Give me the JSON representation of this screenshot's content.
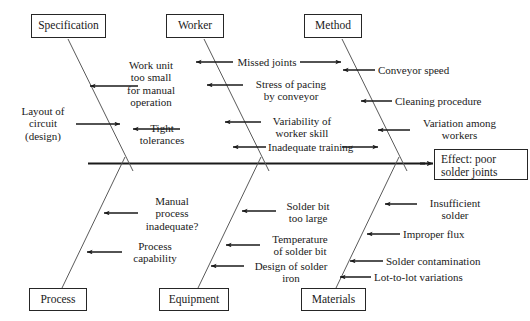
{
  "diagram": {
    "type": "fishbone",
    "line_color": "#262626",
    "background": "#ffffff",
    "effect": {
      "line1": "Effect: poor",
      "line2": "solder joints"
    },
    "categories": [
      {
        "id": "specification",
        "label": "Specification",
        "position": "top"
      },
      {
        "id": "worker",
        "label": "Worker",
        "position": "top"
      },
      {
        "id": "method",
        "label": "Method",
        "position": "top"
      },
      {
        "id": "process",
        "label": "Process",
        "position": "bottom"
      },
      {
        "id": "equipment",
        "label": "Equipment",
        "position": "bottom"
      },
      {
        "id": "materials",
        "label": "Materials",
        "position": "bottom"
      }
    ],
    "causes": {
      "specification": [
        {
          "id": "layout-of-circuit",
          "lines": [
            "Layout of",
            "circuit",
            "(design)"
          ],
          "side": "left",
          "arrow": "right"
        },
        {
          "id": "work-unit-too-small",
          "lines": [
            "Work unit",
            "too small",
            "for manual",
            "operation"
          ],
          "side": "right",
          "arrow": "left"
        },
        {
          "id": "tight-tolerances",
          "lines": [
            "Tight",
            "tolerances"
          ],
          "side": "right",
          "arrow": "left"
        }
      ],
      "worker": [
        {
          "id": "missed-joints",
          "lines": [
            "Missed joints"
          ],
          "side": "right",
          "arrow": "both"
        },
        {
          "id": "stress-of-pacing",
          "lines": [
            "Stress of pacing",
            "by conveyor"
          ],
          "side": "right",
          "arrow": "left"
        },
        {
          "id": "variability-of-worker-skill",
          "lines": [
            "Variability of",
            "worker skill"
          ],
          "side": "right",
          "arrow": "left"
        },
        {
          "id": "inadequate-training",
          "lines": [
            "Inadequate training"
          ],
          "side": "right",
          "arrow": "both"
        }
      ],
      "method": [
        {
          "id": "conveyor-speed",
          "lines": [
            "Conveyor speed"
          ],
          "side": "right",
          "arrow": "left"
        },
        {
          "id": "cleaning-procedure",
          "lines": [
            "Cleaning procedure"
          ],
          "side": "right",
          "arrow": "left"
        },
        {
          "id": "variation-among-workers",
          "lines": [
            "Variation among",
            "workers"
          ],
          "side": "right",
          "arrow": "left"
        }
      ],
      "process": [
        {
          "id": "manual-process-inadequate",
          "lines": [
            "Manual",
            "process",
            "inadequate?"
          ],
          "side": "right",
          "arrow": "left"
        },
        {
          "id": "process-capability",
          "lines": [
            "Process",
            "capability"
          ],
          "side": "right",
          "arrow": "left"
        }
      ],
      "equipment": [
        {
          "id": "solder-bit-too-large",
          "lines": [
            "Solder bit",
            "too large"
          ],
          "side": "right",
          "arrow": "left"
        },
        {
          "id": "temperature-of-solder-bit",
          "lines": [
            "Temperature",
            "of solder bit"
          ],
          "side": "right",
          "arrow": "left"
        },
        {
          "id": "design-of-solder-iron",
          "lines": [
            "Design of solder",
            "iron"
          ],
          "side": "right",
          "arrow": "left"
        }
      ],
      "materials": [
        {
          "id": "insufficient-solder",
          "lines": [
            "Insufficient",
            "solder"
          ],
          "side": "right",
          "arrow": "left"
        },
        {
          "id": "improper-flux",
          "lines": [
            "Improper flux"
          ],
          "side": "right",
          "arrow": "left"
        },
        {
          "id": "solder-contamination",
          "lines": [
            "Solder contamination"
          ],
          "side": "right",
          "arrow": "left"
        },
        {
          "id": "lot-to-lot-variations",
          "lines": [
            "Lot-to-lot variations"
          ],
          "side": "right",
          "arrow": "left"
        }
      ]
    }
  }
}
